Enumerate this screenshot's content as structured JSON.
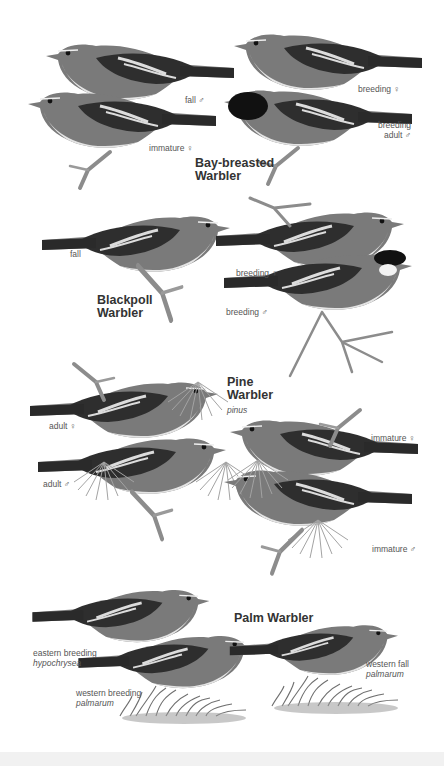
{
  "colors": {
    "background": "#ffffff",
    "label_text": "#555555",
    "title_text": "#333333",
    "bird_dark": "#2b2b2b",
    "bird_mid": "#6e6e6e",
    "bird_light": "#bdbdbd",
    "bird_belly": "#e8e8e8"
  },
  "sections": [
    {
      "species": "Bay-breasted Warbler",
      "title_lines": [
        "Bay-breasted",
        "Warbler"
      ],
      "labels": [
        {
          "text": "fall ♂"
        },
        {
          "text": "immature ♀"
        },
        {
          "text": "breeding ♀"
        },
        {
          "lines": [
            "breeding",
            "adult ♂"
          ]
        }
      ]
    },
    {
      "species": "Blackpoll Warbler",
      "title_lines": [
        "Blackpoll",
        "Warbler"
      ],
      "labels": [
        {
          "text": "fall"
        },
        {
          "text": "breeding ♀"
        },
        {
          "text": "breeding ♂"
        }
      ]
    },
    {
      "species": "Pine Warbler",
      "title_lines": [
        "Pine",
        "Warbler"
      ],
      "subspecies": "pinus",
      "labels": [
        {
          "text": "adult ♀"
        },
        {
          "text": "adult ♂"
        },
        {
          "text": "immature ♀"
        },
        {
          "text": "immature ♂"
        }
      ]
    },
    {
      "species": "Palm Warbler",
      "title_lines": [
        "Palm Warbler"
      ],
      "labels": [
        {
          "text": "eastern breeding",
          "sci": "hypochrysea"
        },
        {
          "text": "western breeding",
          "sci": "palmarum"
        },
        {
          "text": "western fall",
          "sci": "palmarum"
        }
      ]
    }
  ],
  "icons": {
    "bird": "bird-illustration",
    "branch": "branch-illustration",
    "pine-needles": "pine-needles-illustration",
    "grass": "grass-tuft-illustration"
  }
}
